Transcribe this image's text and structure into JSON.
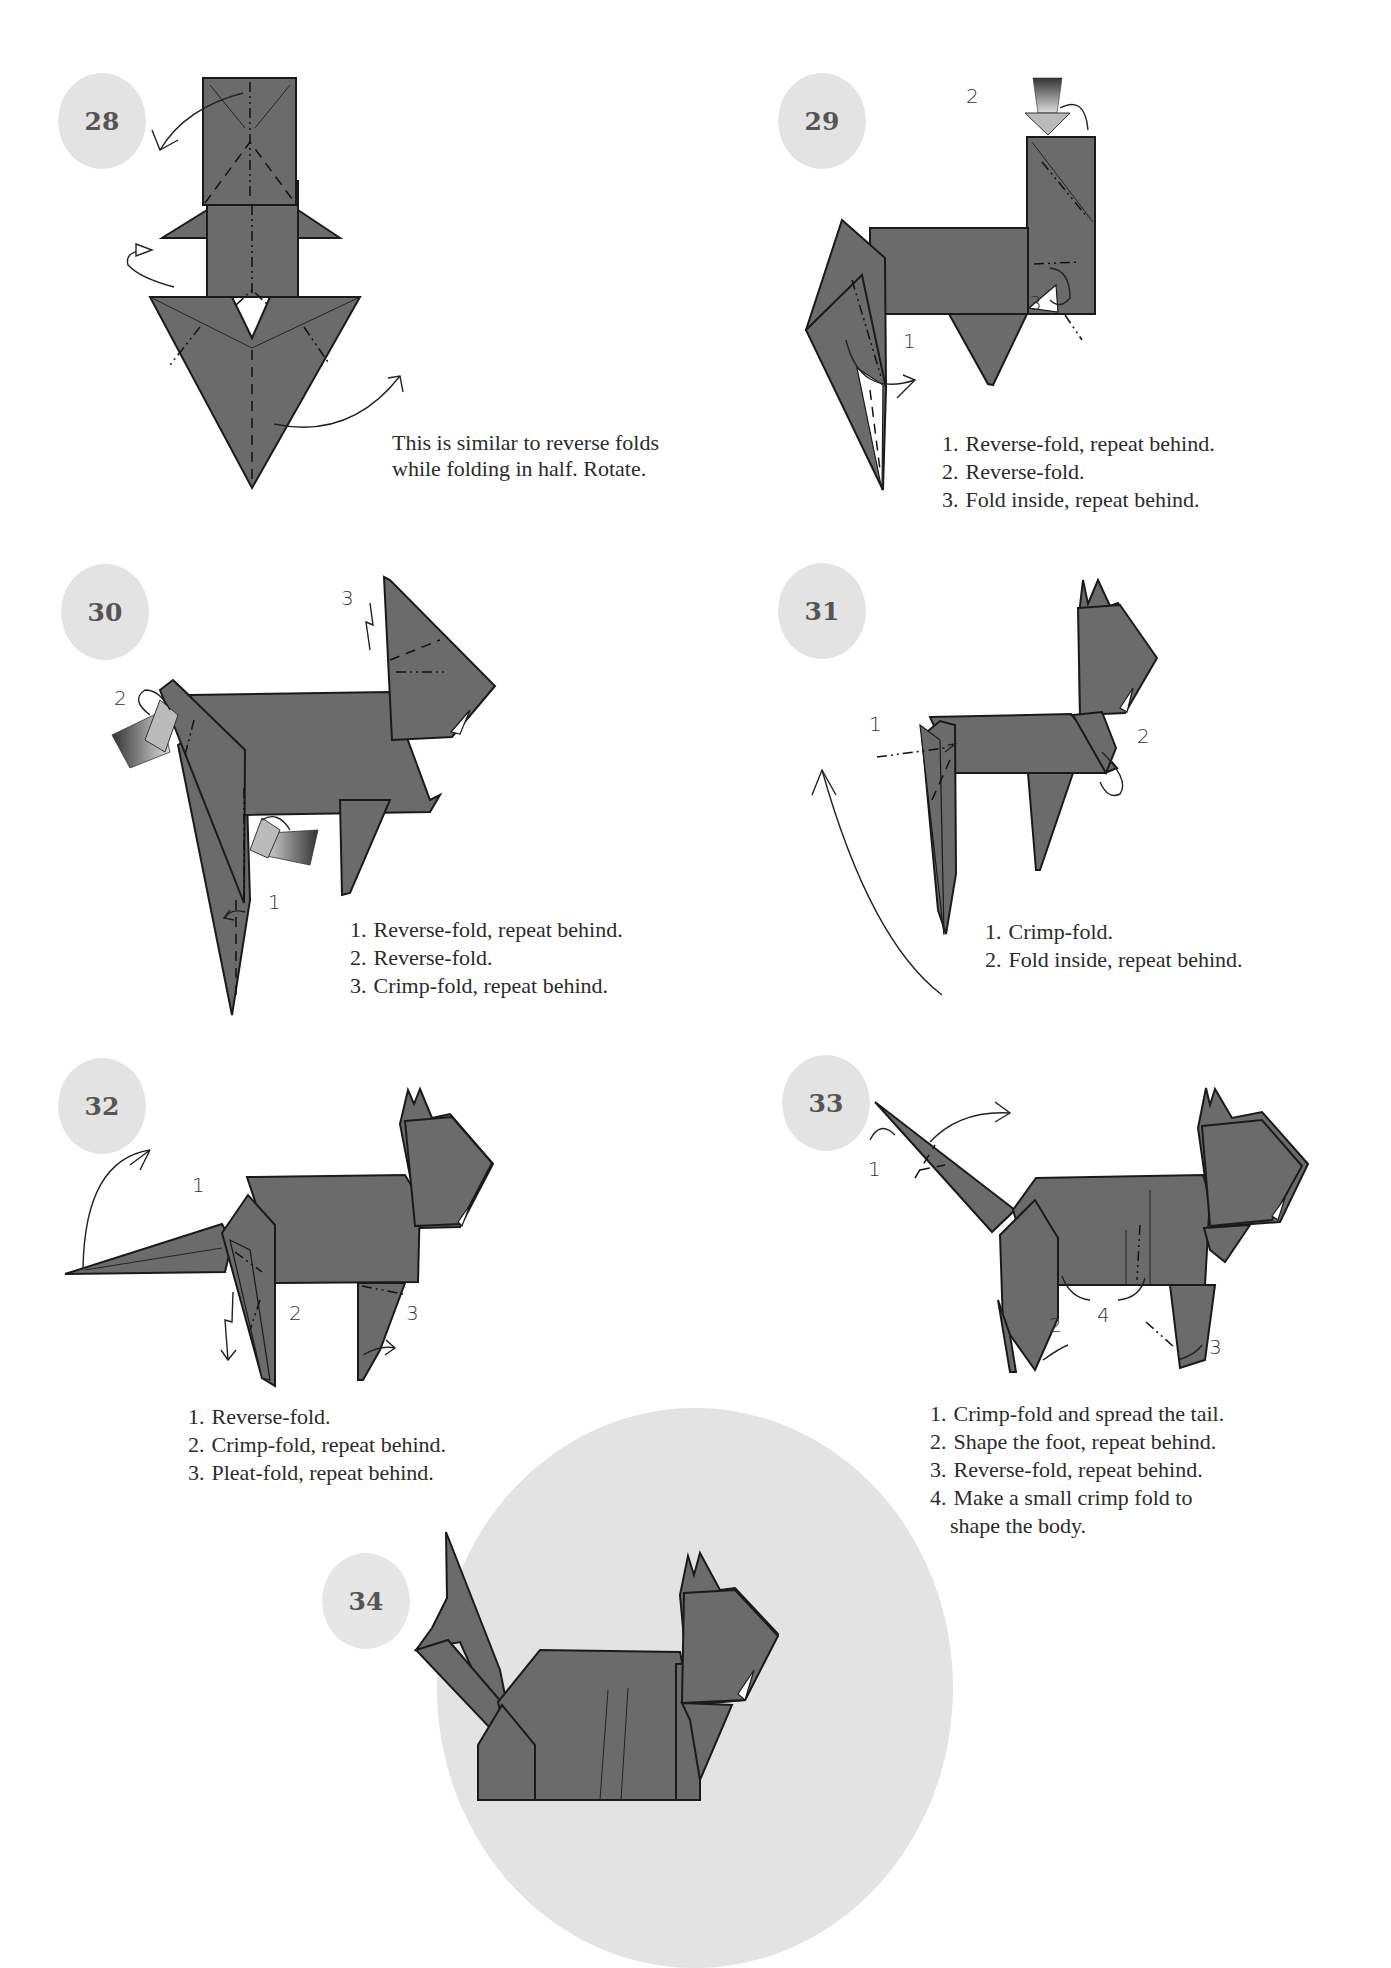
{
  "page": {
    "colors": {
      "paper_fill": "#6b6b6b",
      "outline": "#1a1a1a",
      "badge_fill": "#e3e3e3",
      "badge_text": "#555555",
      "text": "#2b2b2b"
    }
  },
  "steps": [
    {
      "number": "28",
      "caption_lines": [
        "This is similar to reverse folds",
        "while folding in half. Rotate."
      ]
    },
    {
      "number": "29",
      "labels": [
        "1",
        "2",
        "3"
      ],
      "instructions": [
        {
          "num": "1.",
          "text": "Reverse-fold, repeat behind."
        },
        {
          "num": "2.",
          "text": "Reverse-fold."
        },
        {
          "num": "3.",
          "text": "Fold inside, repeat behind."
        }
      ]
    },
    {
      "number": "30",
      "labels": [
        "1",
        "2",
        "3"
      ],
      "instructions": [
        {
          "num": "1.",
          "text": "Reverse-fold, repeat behind."
        },
        {
          "num": "2.",
          "text": "Reverse-fold."
        },
        {
          "num": "3.",
          "text": "Crimp-fold, repeat behind."
        }
      ]
    },
    {
      "number": "31",
      "labels": [
        "1",
        "2"
      ],
      "instructions": [
        {
          "num": "1.",
          "text": "Crimp-fold."
        },
        {
          "num": "2.",
          "text": "Fold inside, repeat behind."
        }
      ]
    },
    {
      "number": "32",
      "labels": [
        "1",
        "2",
        "3"
      ],
      "instructions": [
        {
          "num": "1.",
          "text": "Reverse-fold."
        },
        {
          "num": "2.",
          "text": "Crimp-fold, repeat behind."
        },
        {
          "num": "3.",
          "text": "Pleat-fold, repeat behind."
        }
      ]
    },
    {
      "number": "33",
      "labels": [
        "1",
        "2",
        "3",
        "4"
      ],
      "instructions": [
        {
          "num": "1.",
          "text": "Crimp-fold and spread the tail."
        },
        {
          "num": "2.",
          "text": "Shape the foot, repeat behind."
        },
        {
          "num": "3.",
          "text": "Reverse-fold, repeat behind."
        },
        {
          "num": "4.",
          "text": "Make a small crimp fold to",
          "continuation": "shape the body."
        }
      ]
    },
    {
      "number": "34"
    }
  ]
}
